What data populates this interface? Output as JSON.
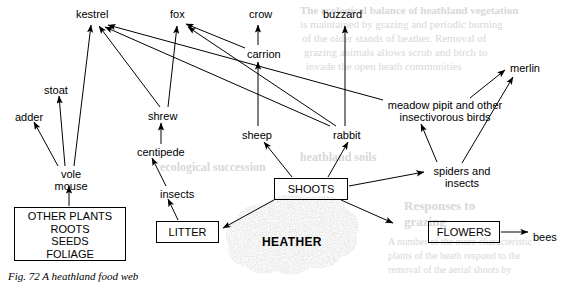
{
  "figure": {
    "caption": "Fig. 72  A heathland food web",
    "caption_number": "Fig. 72",
    "caption_title": "A heathland food web"
  },
  "diagram": {
    "type": "food-web",
    "habitat": "heathland",
    "producer_label": "HEATHER",
    "nodes": [
      {
        "id": "kestrel",
        "label": "kestrel",
        "x": 76,
        "y": 8,
        "style": "plain",
        "trophic": "top-predator"
      },
      {
        "id": "fox",
        "label": "fox",
        "x": 170,
        "y": 8,
        "style": "plain",
        "trophic": "top-predator"
      },
      {
        "id": "crow",
        "label": "crow",
        "x": 249,
        "y": 8,
        "style": "plain",
        "trophic": "top-predator"
      },
      {
        "id": "buzzard",
        "label": "buzzard",
        "x": 323,
        "y": 8,
        "style": "plain",
        "trophic": "top-predator"
      },
      {
        "id": "merlin",
        "label": "merlin",
        "x": 510,
        "y": 62,
        "style": "plain",
        "trophic": "top-predator"
      },
      {
        "id": "carrion",
        "label": "carrion",
        "x": 247,
        "y": 48,
        "style": "plain",
        "trophic": "detritus"
      },
      {
        "id": "stoat",
        "label": "stoat",
        "x": 44,
        "y": 84,
        "style": "plain",
        "trophic": "predator"
      },
      {
        "id": "adder",
        "label": "adder",
        "x": 15,
        "y": 111,
        "style": "plain",
        "trophic": "predator"
      },
      {
        "id": "shrew",
        "label": "shrew",
        "x": 148,
        "y": 110,
        "style": "plain",
        "trophic": "predator"
      },
      {
        "id": "sheep",
        "label": "sheep",
        "x": 242,
        "y": 129,
        "style": "plain",
        "trophic": "herbivore"
      },
      {
        "id": "rabbit",
        "label": "rabbit",
        "x": 333,
        "y": 129,
        "style": "plain",
        "trophic": "herbivore"
      },
      {
        "id": "meadow-pipit",
        "label": "meadow pipit and other\ninsectivorous birds",
        "line1": "meadow pipit and other",
        "line2": "insectivorous birds",
        "x": 385,
        "y": 99,
        "style": "plain",
        "trophic": "insectivore"
      },
      {
        "id": "centipede",
        "label": "centipede",
        "x": 137,
        "y": 146,
        "style": "plain",
        "trophic": "predator"
      },
      {
        "id": "vole-mouse",
        "label": "vole\nmouse",
        "line1": "vole",
        "line2": "mouse",
        "x": 48,
        "y": 168,
        "style": "plain",
        "trophic": "herbivore"
      },
      {
        "id": "spiders-insects",
        "label": "spiders and\ninsects",
        "line1": "spiders and",
        "line2": "insects",
        "x": 430,
        "y": 165,
        "style": "plain",
        "trophic": "invertebrate"
      },
      {
        "id": "insects",
        "label": "insects",
        "x": 160,
        "y": 188,
        "style": "plain",
        "trophic": "invertebrate"
      },
      {
        "id": "bees",
        "label": "bees",
        "x": 533,
        "y": 231,
        "style": "plain",
        "trophic": "pollinator"
      },
      {
        "id": "other-plants",
        "label": "OTHER PLANTS\nROOTS\nSEEDS\nFOLIAGE",
        "lines": [
          "OTHER PLANTS",
          "ROOTS",
          "SEEDS",
          "FOLIAGE"
        ],
        "x": 14,
        "y": 207,
        "w": 112,
        "h": 54,
        "style": "boxed",
        "trophic": "producer"
      },
      {
        "id": "shoots",
        "label": "SHOOTS",
        "x": 274,
        "y": 178,
        "w": 74,
        "h": 22,
        "style": "boxed",
        "trophic": "producer"
      },
      {
        "id": "litter",
        "label": "LITTER",
        "x": 156,
        "y": 221,
        "w": 63,
        "h": 22,
        "style": "boxed",
        "trophic": "detritus"
      },
      {
        "id": "flowers",
        "label": "FLOWERS",
        "x": 428,
        "y": 221,
        "w": 72,
        "h": 22,
        "style": "boxed",
        "trophic": "producer"
      }
    ],
    "links": [
      {
        "from": "vole-mouse",
        "to": "adder"
      },
      {
        "from": "vole-mouse",
        "to": "stoat"
      },
      {
        "from": "vole-mouse",
        "to": "kestrel"
      },
      {
        "from": "other-plants",
        "to": "vole-mouse"
      },
      {
        "from": "shrew",
        "to": "kestrel"
      },
      {
        "from": "shrew",
        "to": "fox"
      },
      {
        "from": "centipede",
        "to": "shrew"
      },
      {
        "from": "insects",
        "to": "centipede"
      },
      {
        "from": "litter",
        "to": "insects"
      },
      {
        "from": "sheep",
        "to": "carrion"
      },
      {
        "from": "carrion",
        "to": "crow"
      },
      {
        "from": "carrion",
        "to": "fox"
      },
      {
        "from": "rabbit",
        "to": "buzzard"
      },
      {
        "from": "rabbit",
        "to": "fox"
      },
      {
        "from": "rabbit",
        "to": "kestrel"
      },
      {
        "from": "meadow-pipit",
        "to": "kestrel"
      },
      {
        "from": "meadow-pipit",
        "to": "merlin"
      },
      {
        "from": "spiders-insects",
        "to": "meadow-pipit"
      },
      {
        "from": "spiders-insects",
        "to": "merlin"
      },
      {
        "from": "shoots",
        "to": "sheep"
      },
      {
        "from": "shoots",
        "to": "rabbit"
      },
      {
        "from": "shoots",
        "to": "spiders-insects"
      },
      {
        "from": "shoots",
        "to": "flowers"
      },
      {
        "from": "shoots",
        "to": "litter"
      },
      {
        "from": "flowers",
        "to": "bees"
      }
    ],
    "colors": {
      "ink": "#000000",
      "paper": "#ffffff",
      "stipple": "#b9b9b9"
    }
  },
  "bleedthrough": {
    "note": "faint reverse-page show-through",
    "lines": [
      {
        "text": "The ecological balance of heathland vegetation",
        "x": 300,
        "y": 4,
        "size": 11,
        "bold": true
      },
      {
        "text": "is maintained by grazing and periodic burning",
        "x": 300,
        "y": 18,
        "size": 11
      },
      {
        "text": "of the older stands of heather. Removal of",
        "x": 302,
        "y": 32,
        "size": 11
      },
      {
        "text": "grazing animals allows scrub and birch to",
        "x": 304,
        "y": 46,
        "size": 11
      },
      {
        "text": "invade the open heath communities",
        "x": 306,
        "y": 60,
        "size": 11
      },
      {
        "text": "ecological succession",
        "x": 160,
        "y": 160,
        "size": 12,
        "bold": true
      },
      {
        "text": "heathland soils",
        "x": 300,
        "y": 150,
        "size": 12,
        "bold": true
      },
      {
        "text": "Responses to",
        "x": 404,
        "y": 198,
        "size": 13,
        "bold": true
      },
      {
        "text": "grazing",
        "x": 404,
        "y": 214,
        "size": 13,
        "bold": true
      },
      {
        "text": "A number of the more characteristic",
        "x": 388,
        "y": 236,
        "size": 10
      },
      {
        "text": "plants of the heath respond to the",
        "x": 388,
        "y": 250,
        "size": 10
      },
      {
        "text": "removal of the aerial shoots by",
        "x": 388,
        "y": 264,
        "size": 10
      }
    ]
  }
}
